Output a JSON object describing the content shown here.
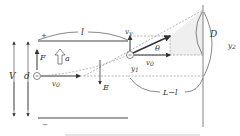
{
  "diagram": {
    "labels": {
      "plate_length": "l",
      "plate_top_sign": "+",
      "plate_bottom_sign": "−",
      "voltage": "V",
      "separation": "d",
      "force": "F",
      "acceleration": "a",
      "initial_velocity_left": "v",
      "initial_velocity_left_sub": "0",
      "field": "E",
      "vertical_velocity": "v",
      "vertical_velocity_sub": "y",
      "horizontal_velocity": "v",
      "horizontal_velocity_sub": "0",
      "deflection_inside": "y",
      "deflection_inside_sub": "1",
      "angle": "θ",
      "screen_offset": "D",
      "total_deflection": "y",
      "total_deflection_sub": "2",
      "drift_length": "L−l",
      "charge_sign": "−"
    },
    "colors": {
      "line": "#444444",
      "dashed": "#888888",
      "shade": "#eeeeee"
    }
  }
}
